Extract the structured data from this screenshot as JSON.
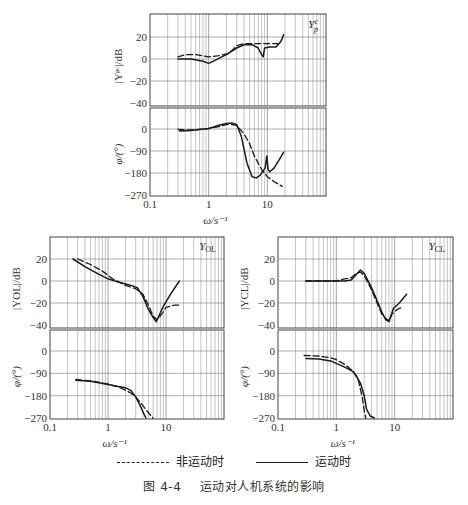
{
  "legend": {
    "dashed_label": "非运动时",
    "solid_label": "运动时"
  },
  "caption": {
    "number": "图 4-4",
    "title": "运动对人机系统的影响"
  },
  "chart_data": [
    {
      "type": "line",
      "title": "Y_p^c",
      "panel_label": "Yp c",
      "xscale": "log",
      "xlim": [
        0.1,
        100
      ],
      "xticks": [
        "0.1",
        "1",
        "10"
      ],
      "xlabel": "ω/s⁻¹",
      "magnitude": {
        "ylabel": "|Y_p^c|/dB",
        "ylim": [
          -40,
          35
        ],
        "yticks": [
          20,
          0,
          -20,
          -40
        ],
        "series": [
          {
            "name": "非运动时",
            "style": "dashed",
            "x": [
              0.3,
              0.4,
              0.6,
              1.0,
              1.5,
              2.2,
              3.0,
              4.0,
              6.0,
              10.0,
              15.0
            ],
            "y": [
              2,
              4,
              4,
              2,
              3,
              5,
              12,
              14,
              14,
              14,
              14
            ]
          },
          {
            "name": "运动时",
            "style": "solid",
            "x": [
              0.3,
              0.5,
              0.8,
              1.0,
              1.3,
              2.0,
              3.0,
              4.0,
              5.5,
              7.0,
              8.0,
              8.5,
              9.0,
              11.0,
              14.0,
              17.0,
              19.0
            ],
            "y": [
              0,
              0,
              -2,
              -4,
              -1,
              4,
              10,
              13,
              13,
              10,
              4,
              2,
              10,
              11,
              11,
              16,
              22
            ]
          }
        ]
      },
      "phase": {
        "ylabel": "φ/(°)",
        "ylim": [
          -270,
          30
        ],
        "yticks": [
          0,
          -90,
          -180,
          -270
        ],
        "series": [
          {
            "name": "非运动时",
            "style": "dashed",
            "x": [
              0.3,
              0.5,
              1.0,
              1.5,
              2.2,
              3.0,
              4.0,
              5.0,
              6.0,
              7.0,
              8.0,
              10.0,
              13.0,
              18.0
            ],
            "y": [
              -2,
              -4,
              2,
              10,
              20,
              15,
              -20,
              -60,
              -110,
              -140,
              -165,
              -195,
              -215,
              -235
            ]
          },
          {
            "name": "运动时",
            "style": "solid",
            "x": [
              0.32,
              0.5,
              1.0,
              1.5,
              2.0,
              2.5,
              3.0,
              3.6,
              4.5,
              5.5,
              6.5,
              7.5,
              8.5,
              9.2,
              9.8,
              10.3,
              11.0,
              13.0,
              16.0,
              19.0
            ],
            "y": [
              -8,
              -6,
              2,
              15,
              22,
              25,
              18,
              -30,
              -140,
              -195,
              -200,
              -190,
              -170,
              -160,
              -110,
              -165,
              -175,
              -160,
              -125,
              -95
            ]
          }
        ]
      }
    },
    {
      "type": "line",
      "title": "Y_OL",
      "panel_label": "YOL",
      "xscale": "log",
      "xlim": [
        0.1,
        100
      ],
      "xticks": [
        "0.1",
        "1",
        "10"
      ],
      "xlabel": "ω/s⁻¹",
      "magnitude": {
        "ylabel": "|Y_OL|/dB",
        "ylim": [
          -40,
          35
        ],
        "yticks": [
          20,
          0,
          -20,
          -40
        ],
        "series": [
          {
            "name": "非运动时",
            "style": "dashed",
            "x": [
              0.3,
              0.5,
              0.8,
              1.2,
              2.0,
              3.0,
              4.0,
              5.0,
              6.0,
              7.0,
              8.5,
              10.0,
              14.0,
              18.0
            ],
            "y": [
              20,
              15,
              9,
              2,
              -4,
              -7,
              -12,
              -22,
              -32,
              -35,
              -30,
              -24,
              -22,
              -22
            ]
          },
          {
            "name": "运动时",
            "style": "solid",
            "x": [
              0.25,
              0.4,
              0.7,
              1.0,
              1.5,
              2.5,
              3.2,
              4.0,
              5.0,
              6.0,
              6.8,
              7.5,
              9.0,
              12.0,
              17.0
            ],
            "y": [
              20,
              13,
              6,
              2,
              -1,
              -4,
              -6,
              -14,
              -26,
              -33,
              -37,
              -32,
              -23,
              -12,
              0
            ]
          }
        ]
      },
      "phase": {
        "ylabel": "φ/(°)",
        "ylim": [
          -270,
          30
        ],
        "yticks": [
          0,
          -90,
          -180,
          -270
        ],
        "series": [
          {
            "name": "非运动时",
            "style": "dashed",
            "x": [
              0.28,
              0.5,
              1.0,
              1.5,
              2.0,
              2.5,
              3.0,
              4.0,
              5.0,
              6.0
            ],
            "y": [
              -115,
              -120,
              -133,
              -145,
              -158,
              -170,
              -185,
              -220,
              -250,
              -270
            ]
          },
          {
            "name": "运动时",
            "style": "solid",
            "x": [
              0.28,
              0.5,
              1.0,
              1.5,
              2.0,
              2.5,
              3.0,
              3.5,
              4.0,
              4.5
            ],
            "y": [
              -118,
              -122,
              -135,
              -143,
              -148,
              -160,
              -185,
              -215,
              -245,
              -270
            ]
          }
        ]
      }
    },
    {
      "type": "line",
      "title": "Y_CL",
      "panel_label": "YCL",
      "xscale": "log",
      "xlim": [
        0.1,
        100
      ],
      "xticks": [
        "0.1",
        "1",
        "10"
      ],
      "xlabel": "ω/s⁻¹",
      "magnitude": {
        "ylabel": "|Y_CL|/dB",
        "ylim": [
          -40,
          35
        ],
        "yticks": [
          20,
          0,
          -20,
          -40
        ],
        "series": [
          {
            "name": "非运动时",
            "style": "dashed",
            "x": [
              0.3,
              0.6,
              1.0,
              1.4,
              1.8,
              2.2,
              2.6,
              3.0,
              4.0,
              5.0,
              6.0,
              7.0,
              8.0,
              9.0,
              11.0,
              14.0
            ],
            "y": [
              0,
              0,
              0,
              2,
              3,
              7,
              8,
              5,
              -8,
              -20,
              -30,
              -34,
              -36,
              -30,
              -26,
              -23
            ]
          },
          {
            "name": "运动时",
            "style": "solid",
            "x": [
              0.3,
              0.6,
              1.0,
              1.4,
              1.8,
              2.2,
              2.6,
              3.0,
              4.0,
              5.0,
              6.0,
              7.0,
              8.0,
              8.5,
              9.5,
              12.0,
              16.0
            ],
            "y": [
              0,
              0,
              0,
              0,
              1,
              6,
              10,
              7,
              -6,
              -18,
              -28,
              -35,
              -37,
              -33,
              -25,
              -20,
              -12
            ]
          }
        ]
      },
      "phase": {
        "ylabel": "φ/(°)",
        "ylim": [
          -270,
          30
        ],
        "yticks": [
          0,
          -90,
          -180,
          -270
        ],
        "series": [
          {
            "name": "非运动时",
            "style": "dashed",
            "x": [
              0.28,
              0.5,
              0.8,
              1.0,
              1.3,
              1.6,
              2.0,
              2.4,
              2.8,
              3.0,
              3.2
            ],
            "y": [
              -18,
              -20,
              -28,
              -35,
              -50,
              -65,
              -85,
              -120,
              -190,
              -240,
              -270
            ]
          },
          {
            "name": "运动时",
            "style": "solid",
            "x": [
              0.3,
              0.5,
              0.8,
              1.0,
              1.3,
              1.6,
              1.9,
              2.2,
              2.6,
              3.0,
              3.3,
              3.8,
              4.5
            ],
            "y": [
              -30,
              -32,
              -40,
              -50,
              -62,
              -72,
              -82,
              -100,
              -130,
              -180,
              -235,
              -262,
              -270
            ]
          }
        ]
      }
    }
  ]
}
